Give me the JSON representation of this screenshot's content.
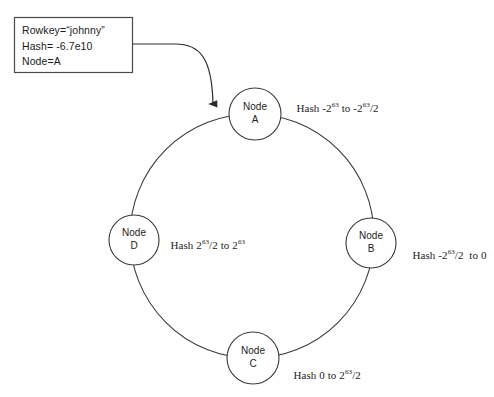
{
  "diagram": {
    "background_color": "#ffffff",
    "stroke_color": "#333333",
    "text_color": "#1c1c1c",
    "callout": {
      "lines": [
        "Rowkey=“johnny”",
        "Hash= -6.7e10",
        "Node=A"
      ],
      "rowkey": "Rowkey=“johnny”",
      "hash": "Hash= -6.7e10",
      "node": "Node=A"
    },
    "nodes": [
      {
        "id": "a",
        "name_top": "Node",
        "name_bottom": "A",
        "range_prefix": "Hash -2",
        "range_exp1": "63",
        "range_mid": " to -2",
        "range_exp2": "63",
        "range_suffix": "/2"
      },
      {
        "id": "b",
        "name_top": "Node",
        "name_bottom": "B",
        "range_prefix": "Hash -2",
        "range_exp1": "63",
        "range_mid": "/2",
        "range_exp2": "",
        "range_suffix": "  to 0"
      },
      {
        "id": "c",
        "name_top": "Node",
        "name_bottom": "C",
        "range_prefix": "Hash 0 to 2",
        "range_exp1": "63",
        "range_mid": "",
        "range_exp2": "",
        "range_suffix": "/2"
      },
      {
        "id": "d",
        "name_top": "Node",
        "name_bottom": "D",
        "range_prefix": "Hash 2",
        "range_exp1": "63",
        "range_mid": "/2 to 2",
        "range_exp2": "63",
        "range_suffix": ""
      }
    ]
  }
}
